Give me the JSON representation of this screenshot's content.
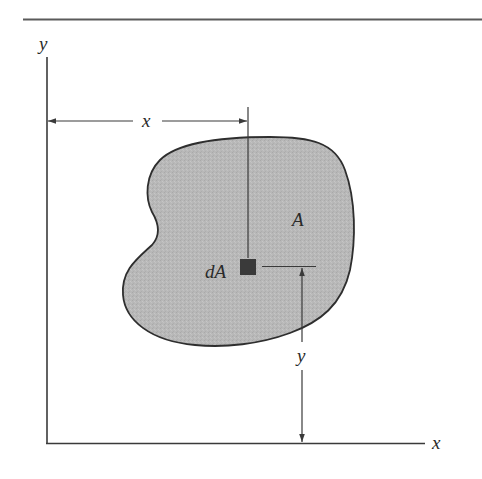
{
  "diagram": {
    "axes": {
      "x_label": "x",
      "y_label": "y"
    },
    "region": {
      "label": "A",
      "fill_color": "#b9b9b9",
      "stroke_color": "#2e2e2e"
    },
    "element": {
      "label": "dA",
      "fill_color": "#3a3a3a"
    },
    "dimensions": {
      "horizontal_label": "x",
      "vertical_label": "y"
    },
    "colors": {
      "line": "#3a3a3a",
      "rule": "#555555",
      "background": "#ffffff"
    }
  }
}
